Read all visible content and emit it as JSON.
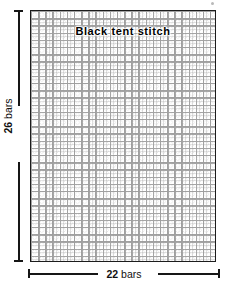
{
  "figure": {
    "type": "needlepoint-canvas-diagram",
    "stitch_label": "Black tent stitch",
    "width_dimension": {
      "value": "22",
      "unit": "bars",
      "text": "22 bars"
    },
    "height_dimension": {
      "value": "26",
      "unit": "bars",
      "text": "26 bars"
    },
    "colors": {
      "border": "#1c1c1c",
      "mesh_thread": "#9d9d9d",
      "text": "#000000",
      "dimension_line": "#161616",
      "background": "#ffffff"
    }
  }
}
